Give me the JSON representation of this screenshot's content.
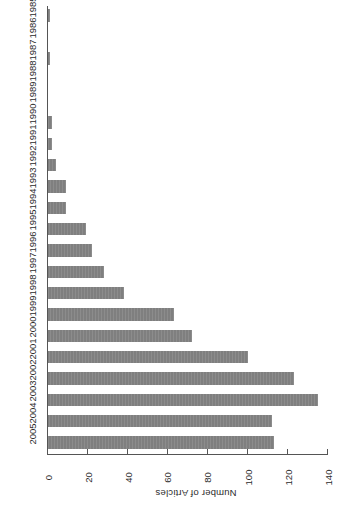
{
  "figure": {
    "rotation_degrees": 180,
    "background_color": "#ffffff",
    "bar_color": "#7f7f7f",
    "axis_color": "#555555",
    "text_color": "#2b2b2b"
  },
  "chart_data": {
    "type": "bar",
    "orientation": "horizontal",
    "title": "",
    "xlabel": "",
    "ylabel": "Number of Articles",
    "value_axis_label": "Number of Articles",
    "categories": [
      "2005",
      "2004",
      "2003",
      "2002",
      "2001",
      "2000",
      "1999",
      "1998",
      "1997",
      "1996",
      "1995",
      "1994",
      "1993",
      "1992",
      "1991",
      "1990",
      "1989",
      "1988",
      "1987",
      "1986",
      "1985"
    ],
    "values": [
      113,
      112,
      135,
      123,
      100,
      72,
      63,
      38,
      28,
      22,
      19,
      9,
      9,
      4,
      2,
      2,
      0,
      0,
      1,
      0,
      1
    ],
    "ticks": [
      0,
      20,
      40,
      60,
      80,
      100,
      120,
      140
    ],
    "tick_labels": [
      "0",
      "20",
      "40",
      "60",
      "80",
      "100",
      "120",
      "140"
    ],
    "xlim": [
      0,
      140
    ],
    "grid": false,
    "legend": null
  }
}
